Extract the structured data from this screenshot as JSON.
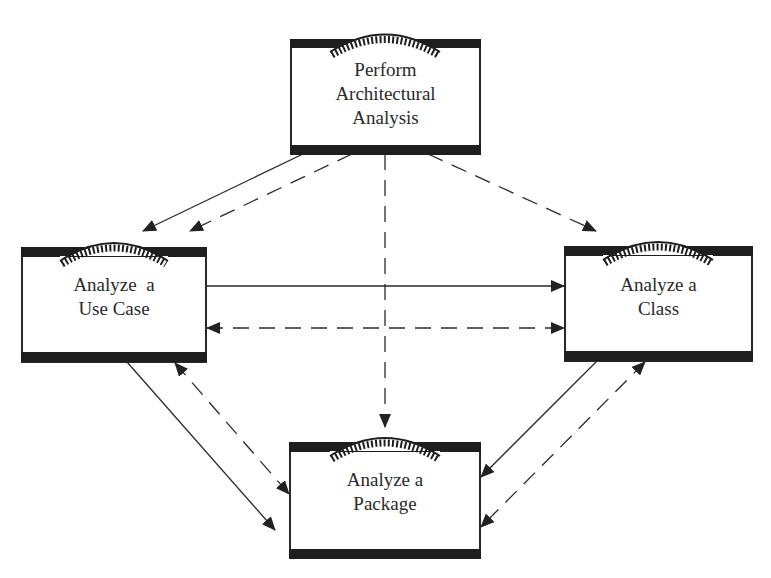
{
  "diagram": {
    "type": "activity-workflow",
    "colors": {
      "stroke": "#2a2a2a",
      "bar": "#1e1e1e",
      "background": "#ffffff"
    },
    "nodes": [
      {
        "id": "perform-architectural-analysis",
        "lines": [
          "Perform",
          "Architectural",
          "Analysis"
        ],
        "box": {
          "x": 291,
          "y": 40,
          "w": 189,
          "h": 114
        }
      },
      {
        "id": "analyze-use-case",
        "lines": [
          "Analyze  a",
          "Use Case"
        ],
        "box": {
          "x": 22,
          "y": 248,
          "w": 184,
          "h": 114
        }
      },
      {
        "id": "analyze-class",
        "lines": [
          "Analyze a",
          "Class"
        ],
        "box": {
          "x": 565,
          "y": 247,
          "w": 187,
          "h": 114
        }
      },
      {
        "id": "analyze-package",
        "lines": [
          "Analyze a",
          "Package"
        ],
        "box": {
          "x": 290,
          "y": 443,
          "w": 190,
          "h": 115
        }
      }
    ],
    "edges": [
      {
        "from": "perform-architectural-analysis",
        "to": "analyze-use-case",
        "style": "solid",
        "arrow": "end"
      },
      {
        "from": "perform-architectural-analysis",
        "to": "analyze-use-case",
        "style": "dashed",
        "arrow": "end"
      },
      {
        "from": "perform-architectural-analysis",
        "to": "analyze-package",
        "style": "dashed",
        "arrow": "end"
      },
      {
        "from": "perform-architectural-analysis",
        "to": "analyze-class",
        "style": "dashed",
        "arrow": "end"
      },
      {
        "from": "analyze-use-case",
        "to": "analyze-class",
        "style": "solid",
        "arrow": "end"
      },
      {
        "from": "analyze-use-case",
        "to": "analyze-class",
        "style": "dashed",
        "arrow": "both"
      },
      {
        "from": "analyze-use-case",
        "to": "analyze-package",
        "style": "solid",
        "arrow": "end"
      },
      {
        "from": "analyze-use-case",
        "to": "analyze-package",
        "style": "dashed",
        "arrow": "both"
      },
      {
        "from": "analyze-class",
        "to": "analyze-package",
        "style": "solid",
        "arrow": "end"
      },
      {
        "from": "analyze-class",
        "to": "analyze-package",
        "style": "dashed",
        "arrow": "both"
      }
    ]
  },
  "labels": {
    "perform_1": "Perform",
    "perform_2": "Architectural",
    "perform_3": "Analysis",
    "usecase_1": "Analyze  a",
    "usecase_2": "Use Case",
    "class_1": "Analyze a",
    "class_2": "Class",
    "package_1": "Analyze a",
    "package_2": "Package"
  }
}
